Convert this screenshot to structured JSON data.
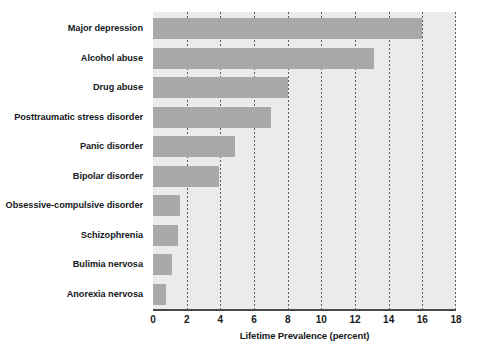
{
  "chart_data": {
    "type": "bar",
    "orientation": "horizontal",
    "title": "",
    "xlabel": "Lifetime Prevalence (percent)",
    "ylabel": "",
    "xlim": [
      0,
      18
    ],
    "xticks": [
      0,
      2,
      4,
      6,
      8,
      10,
      12,
      14,
      16,
      18
    ],
    "xtick_labels": [
      "0",
      "2",
      "4",
      "6",
      "8",
      "10",
      "12",
      "14",
      "16",
      "18"
    ],
    "grid": "vertical-dotted",
    "legend": "none",
    "categories": [
      "Major depression",
      "Alcohol abuse",
      "Drug abuse",
      "Posttraumatic stress disorder",
      "Panic disorder",
      "Bipolar disorder",
      "Obsessive-compulsive disorder",
      "Schizophrenia",
      "Bulimia nervosa",
      "Anorexia nervosa"
    ],
    "values": [
      16.0,
      13.1,
      8.0,
      7.0,
      4.9,
      3.9,
      1.6,
      1.5,
      1.1,
      0.8
    ],
    "bar_color": "#a9a9a9",
    "plot_background_color": "#ebebeb",
    "page_background_color": "#ffffff",
    "axis_color": "#46494b",
    "text_color": "#15191c",
    "gridline_color": "#5c5c5c"
  }
}
